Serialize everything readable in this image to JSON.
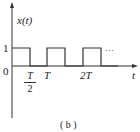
{
  "figure": {
    "caption": "( b )",
    "y_axis_label": "x(t)",
    "x_axis_label": "t",
    "y_ticks": [
      {
        "label": "1",
        "value": 1
      },
      {
        "label": "0",
        "value": 0
      }
    ],
    "x_ticks": [
      {
        "label": "T/2",
        "numerator": "T",
        "denominator": "2",
        "value": 0.5
      },
      {
        "label": "T",
        "value": 1
      },
      {
        "label": "2T",
        "value": 2
      }
    ],
    "continuation": "···",
    "colors": {
      "line": "#333333",
      "background": "#ffffff"
    }
  },
  "signal": {
    "type": "square-wave",
    "amplitude": 1,
    "period": "T",
    "duty_cycle": 0.5,
    "segments": [
      {
        "from": 0,
        "to": 0.5,
        "value": 1
      },
      {
        "from": 0.5,
        "to": 1,
        "value": 0
      },
      {
        "from": 1,
        "to": 1.5,
        "value": 1
      },
      {
        "from": 1.5,
        "to": 2,
        "value": 0
      },
      {
        "from": 2,
        "to": 2.5,
        "value": 1
      },
      {
        "from": 2.5,
        "to": 3,
        "value": 0
      }
    ]
  }
}
